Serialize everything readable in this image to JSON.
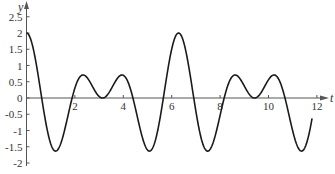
{
  "chart_data": {
    "type": "line",
    "title": "",
    "xlabel": "t",
    "ylabel": "y",
    "function": "y = cos(2t) + cos(3t)",
    "xlim": [
      0,
      12.5
    ],
    "ylim": [
      -2,
      2.9
    ],
    "grid": false,
    "legend": null,
    "x_ticks": [
      2,
      4,
      6,
      8,
      10,
      12
    ],
    "x_tick_labels": [
      "2",
      "4",
      "6",
      "8",
      "10",
      "12"
    ],
    "y_ticks": [
      2.5,
      2,
      1.5,
      1,
      0.5,
      0,
      -0.5,
      -1,
      -1.5,
      -2
    ],
    "y_tick_labels": [
      "2.5",
      "2",
      "1.5",
      "1",
      "0.5",
      "0",
      "-0.5",
      "-1",
      "-1.5",
      "-2"
    ],
    "series": [
      {
        "name": "y(t)",
        "color": "#1a1a1a",
        "t_start": 0,
        "t_end": 11.8,
        "key_points": [
          {
            "t": 0,
            "y": 2.0
          },
          {
            "t": 0.65,
            "y": 0.0
          },
          {
            "t": 1.25,
            "y": -1.62
          },
          {
            "t": 1.9,
            "y": 0.0
          },
          {
            "t": 2.3,
            "y": 0.7
          },
          {
            "t": 3.14,
            "y": 0.0
          },
          {
            "t": 3.98,
            "y": 0.7
          },
          {
            "t": 4.4,
            "y": 0.0
          },
          {
            "t": 5.03,
            "y": -1.62
          },
          {
            "t": 5.65,
            "y": 0.0
          },
          {
            "t": 6.28,
            "y": 2.0
          },
          {
            "t": 6.9,
            "y": 0.0
          },
          {
            "t": 7.53,
            "y": -1.62
          },
          {
            "t": 8.2,
            "y": 0.0
          },
          {
            "t": 8.6,
            "y": 0.7
          },
          {
            "t": 9.42,
            "y": 0.0
          },
          {
            "t": 10.27,
            "y": 0.7
          },
          {
            "t": 10.7,
            "y": 0.0
          },
          {
            "t": 11.3,
            "y": -1.62
          },
          {
            "t": 11.8,
            "y": -0.63
          }
        ]
      }
    ]
  }
}
